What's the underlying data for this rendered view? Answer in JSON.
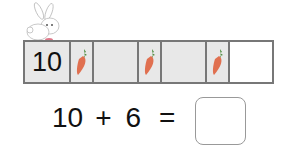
{
  "ten_frame": {
    "cells": [
      {
        "type": "number",
        "value": "10"
      },
      {
        "type": "carrot"
      },
      {
        "type": "empty"
      },
      {
        "type": "carrot"
      },
      {
        "type": "empty"
      },
      {
        "type": "carrot"
      },
      {
        "type": "blank"
      }
    ]
  },
  "equation": {
    "left": "10",
    "operator": "+",
    "right": "6",
    "equals": "=",
    "answer": ""
  },
  "colors": {
    "border": "#777777",
    "cell_fill": "#e8e8e8",
    "carrot": "#e07050",
    "carrot_leaf": "#4a8a3a"
  }
}
